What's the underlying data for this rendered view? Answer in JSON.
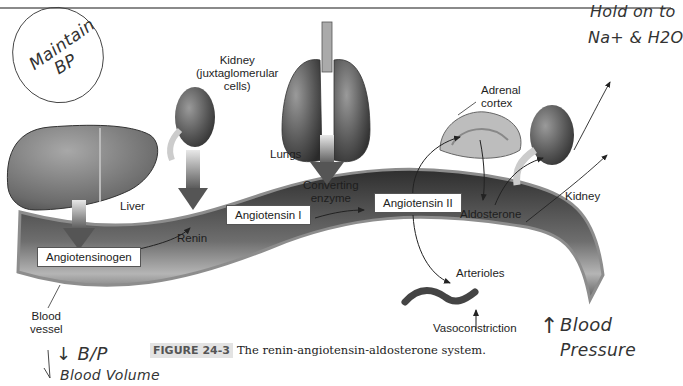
{
  "figure": {
    "label": "FIGURE 24-3",
    "caption": "The renin-angiotensin-aldosterone system."
  },
  "organs": {
    "liver": "Liver",
    "kidney_jg": [
      "Kidney",
      "(juxtaglomerular",
      "cells)"
    ],
    "lungs": "Lungs",
    "adrenal": [
      "Adrenal",
      "cortex"
    ],
    "kidney": "Kidney",
    "blood_vessel": [
      "Blood",
      "vessel"
    ],
    "arterioles": "Arterioles"
  },
  "substances": {
    "angiotensinogen": "Angiotensinogen",
    "renin": "Renin",
    "angiotensin_1": "Angiotensin I",
    "converting_enzyme": [
      "Converting",
      "enzyme"
    ],
    "angiotensin_2": "Angiotensin II",
    "aldosterone": "Aldosterone",
    "vasoconstriction": "Vasoconstriction"
  },
  "handwritten": {
    "maintain": "Maintain",
    "bp": "BP",
    "hold_on": "Hold on to",
    "na_h2o": "Na+ & H2O",
    "low_bp": "↓ B/P",
    "blood_volume": "Blood Volume",
    "up_arrow": "↑",
    "blood": "Blood",
    "pressure": "Pressure"
  },
  "colors": {
    "vessel_dark": "#3a3a3a",
    "vessel_wall": "#8d8d8d",
    "organ": "#4a4a4a",
    "caption_label_bg": "#e3e3e3"
  }
}
